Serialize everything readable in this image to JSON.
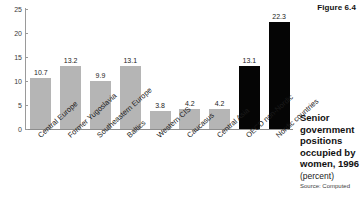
{
  "figure": {
    "label": "Figure 6.4"
  },
  "caption": {
    "title": "Senior government positions occupied by women, 1996",
    "unit": "(percent)",
    "source": "Source: Computed"
  },
  "chart_data": {
    "type": "bar",
    "title": "Senior government positions occupied by women, 1996",
    "subtitle": "(percent)",
    "xlabel": "",
    "ylabel": "",
    "ylim": [
      0,
      25
    ],
    "yticks": [
      0,
      5,
      10,
      15,
      20,
      25
    ],
    "grid": false,
    "legend": "none",
    "categories": [
      "Central Europe",
      "Former Yugoslavia",
      "Southeastern Europe",
      "Baltics",
      "Western CIS",
      "Caucasus",
      "Central Asia",
      "OECD non-Nordic",
      "Nordic countries"
    ],
    "values": [
      10.7,
      13.2,
      9.9,
      13.1,
      3.8,
      4.2,
      4.2,
      13.1,
      22.3
    ],
    "value_labels": [
      "10.7",
      "13.2",
      "9.9",
      "13.1",
      "3.8",
      "4.2",
      "4.2",
      "13.1",
      "22.3"
    ],
    "bar_colors": [
      "#b5b5b5",
      "#b5b5b5",
      "#b5b5b5",
      "#b5b5b5",
      "#b5b5b5",
      "#b5b5b5",
      "#b5b5b5",
      "#050505",
      "#050505"
    ]
  },
  "colors": {
    "transition_bar": "#b5b5b5",
    "reference_bar": "#050505",
    "axis": "#9a9a9a",
    "text": "#1a1a1a"
  }
}
